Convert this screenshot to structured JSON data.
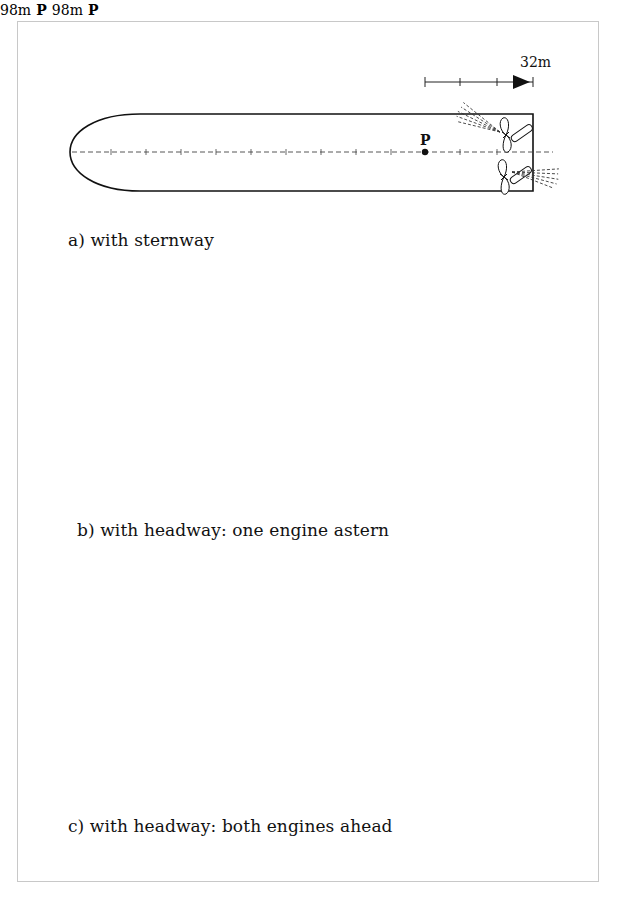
{
  "figure": {
    "panels": [
      {
        "id": "a",
        "caption": "a) with sternway",
        "distance_label": "32m",
        "pivot_label": "P",
        "scale_ticks": 3,
        "engines": {
          "port": "astern",
          "starboard": "astern"
        }
      },
      {
        "id": "b",
        "caption": "b) with headway: one engine astern",
        "distance_label": "98m",
        "pivot_label": "P",
        "scale_ticks": 10,
        "engines": {
          "port": "astern",
          "starboard": "ahead"
        }
      },
      {
        "id": "c",
        "caption": "c) with headway: both engines ahead",
        "distance_label": "98m",
        "pivot_label": "P",
        "scale_ticks": 10,
        "engines": {
          "port": "ahead",
          "starboard": "ahead"
        }
      }
    ]
  }
}
